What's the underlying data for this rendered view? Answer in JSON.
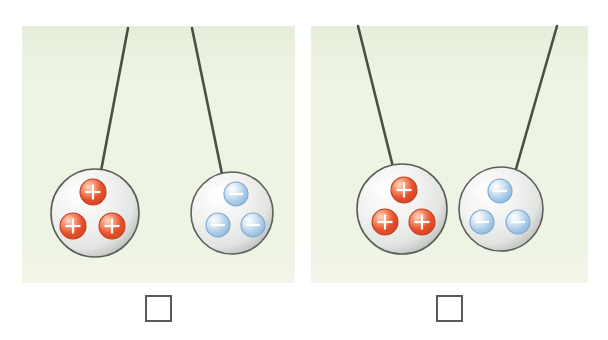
{
  "figure": {
    "name": "charged-spheres-pairs",
    "background_color": "#ffffff",
    "panel_color": "#eef4e4",
    "panel_color_edge": "#e6eedb",
    "string_color": "#4a4f48",
    "sphere_fill_light": "#fdfdfd",
    "sphere_fill_mid": "#e2e4e2",
    "sphere_fill_shadow": "#b9bcb8",
    "sphere_outline": "#5b5f5a",
    "positive_color": "#e8502c",
    "positive_color_light": "#f79b78",
    "positive_outline": "#c23f1f",
    "negative_color": "#a8cbe8",
    "negative_color_light": "#dcebf7",
    "negative_outline": "#7fa8cc",
    "checkbox_border_color": "#5a5a5a",
    "checkbox_fill": "#ffffff"
  },
  "panels": [
    {
      "id": "panel-left",
      "label": "left-panel",
      "x": 22,
      "y": 26,
      "width": 273,
      "height": 257,
      "checkbox": {
        "label": "",
        "checked": false,
        "x": 146,
        "y": 296,
        "size": 25
      },
      "spheres": [
        {
          "id": "sphere-left-positive",
          "charge_sign": "+",
          "charge_count": 3,
          "charge_type": "positive",
          "cx": 95,
          "cy": 213,
          "r": 44,
          "string": {
            "x1": 128,
            "y1": 28,
            "x2": 101,
            "y2": 171
          },
          "charges": [
            {
              "cx": 93,
              "cy": 192,
              "r": 13,
              "symbol": "+"
            },
            {
              "cx": 73,
              "cy": 226,
              "r": 13,
              "symbol": "+"
            },
            {
              "cx": 112,
              "cy": 226,
              "r": 13,
              "symbol": "+"
            }
          ]
        },
        {
          "id": "sphere-left-negative",
          "charge_sign": "−",
          "charge_count": 3,
          "charge_type": "negative",
          "cx": 232,
          "cy": 213,
          "r": 41,
          "string": {
            "x1": 192,
            "y1": 28,
            "x2": 222,
            "y2": 174
          },
          "charges": [
            {
              "cx": 236,
              "cy": 194,
              "r": 12,
              "symbol": "−"
            },
            {
              "cx": 218,
              "cy": 225,
              "r": 12,
              "symbol": "−"
            },
            {
              "cx": 253,
              "cy": 225,
              "r": 12,
              "symbol": "−"
            }
          ]
        }
      ]
    },
    {
      "id": "panel-right",
      "label": "right-panel",
      "x": 311,
      "y": 26,
      "width": 277,
      "height": 257,
      "checkbox": {
        "label": "",
        "checked": false,
        "x": 437,
        "y": 296,
        "size": 25
      },
      "spheres": [
        {
          "id": "sphere-right-positive",
          "charge_sign": "+",
          "charge_count": 3,
          "charge_type": "positive",
          "cx": 402,
          "cy": 209,
          "r": 45,
          "string": {
            "x1": 358,
            "y1": 26,
            "x2": 393,
            "y2": 167
          },
          "charges": [
            {
              "cx": 404,
              "cy": 190,
              "r": 13,
              "symbol": "+"
            },
            {
              "cx": 385,
              "cy": 222,
              "r": 13,
              "symbol": "+"
            },
            {
              "cx": 422,
              "cy": 222,
              "r": 13,
              "symbol": "+"
            }
          ]
        },
        {
          "id": "sphere-right-negative",
          "charge_sign": "−",
          "charge_count": 3,
          "charge_type": "negative",
          "cx": 501,
          "cy": 209,
          "r": 42,
          "string": {
            "x1": 557,
            "y1": 26,
            "x2": 516,
            "y2": 169
          },
          "charges": [
            {
              "cx": 500,
              "cy": 191,
              "r": 12,
              "symbol": "−"
            },
            {
              "cx": 482,
              "cy": 222,
              "r": 12,
              "symbol": "−"
            },
            {
              "cx": 518,
              "cy": 222,
              "r": 12,
              "symbol": "−"
            }
          ]
        }
      ]
    }
  ]
}
